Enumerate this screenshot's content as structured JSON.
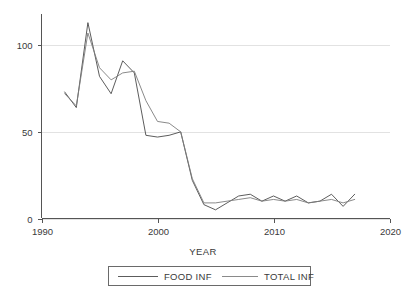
{
  "chart_data": {
    "type": "line",
    "title": "",
    "subtitle": "",
    "xlabel": "YEAR",
    "ylabel": "",
    "xlim": [
      1990,
      2020
    ],
    "ylim": [
      0,
      118
    ],
    "xticks": [
      1990,
      2000,
      2010,
      2020
    ],
    "yticks": [
      0,
      50,
      100
    ],
    "xtick_labels": [
      "1990",
      "2000",
      "2010",
      "2020"
    ],
    "ytick_labels": [
      "0",
      "50",
      "100"
    ],
    "grid": true,
    "grid_axis": "y",
    "legend_position": "bottom-center",
    "x": [
      1992,
      1993,
      1994,
      1995,
      1996,
      1997,
      1998,
      1999,
      2000,
      2001,
      2002,
      2003,
      2004,
      2005,
      2006,
      2007,
      2008,
      2009,
      2010,
      2011,
      2012,
      2013,
      2014,
      2015,
      2016,
      2017
    ],
    "series": [
      {
        "name": "FOOD INF",
        "color": "#4a4a4a",
        "values": [
          73,
          64,
          113,
          82,
          72,
          91,
          84,
          48,
          47,
          48,
          50,
          22,
          8,
          5,
          9,
          13,
          14,
          10,
          13,
          10,
          13,
          9,
          10,
          14,
          7,
          14
        ]
      },
      {
        "name": "TOTAL INF",
        "color": "#7d7d7d",
        "values": [
          72,
          65,
          107,
          87,
          80,
          84,
          85,
          68,
          56,
          55,
          50,
          23,
          9,
          9,
          10,
          11,
          12,
          10,
          11,
          10,
          11,
          9,
          10,
          11,
          9,
          11
        ]
      }
    ],
    "annotations": []
  },
  "legend": {
    "entries": [
      {
        "label": "FOOD INF"
      },
      {
        "label": "TOTAL INF"
      }
    ]
  },
  "axes": {
    "x_title": "YEAR"
  }
}
